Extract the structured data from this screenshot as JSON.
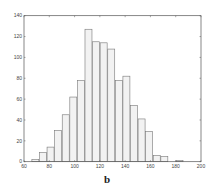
{
  "caption": "b",
  "chart_data": {
    "type": "bar",
    "title": "",
    "xlabel": "",
    "ylabel": "",
    "xlim": [
      60,
      200
    ],
    "ylim": [
      0,
      140
    ],
    "grid": false,
    "bin_width": 6,
    "bin_starts": [
      66,
      72,
      78,
      84,
      90,
      96,
      102,
      108,
      114,
      120,
      126,
      132,
      138,
      144,
      150,
      156,
      162,
      168,
      174,
      180
    ],
    "values": [
      2,
      9,
      14,
      30,
      45,
      62,
      78,
      127,
      115,
      114,
      108,
      78,
      82,
      54,
      41,
      29,
      6,
      5,
      0,
      1
    ],
    "xticks": [
      60,
      80,
      100,
      120,
      140,
      160,
      180,
      200
    ],
    "yticks": [
      0,
      20,
      40,
      60,
      80,
      100,
      120,
      140
    ],
    "bar_fill": "#f2f2f2",
    "bar_edge": "#777777",
    "axis_color": "#555555"
  }
}
